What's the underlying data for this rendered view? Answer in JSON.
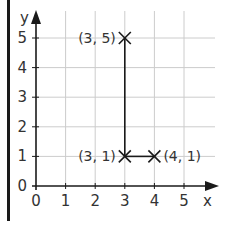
{
  "chart_data": {
    "type": "scatter",
    "title": "",
    "xlabel": "x",
    "ylabel": "y",
    "xlim": [
      0,
      5
    ],
    "ylim": [
      0,
      5
    ],
    "grid": true,
    "x_ticks": [
      "0",
      "1",
      "2",
      "3",
      "4",
      "5"
    ],
    "y_ticks": [
      "0",
      "1",
      "2",
      "3",
      "4",
      "5"
    ],
    "points": [
      {
        "x": 3,
        "y": 5,
        "label": "(3, 5)",
        "label_side": "left"
      },
      {
        "x": 3,
        "y": 1,
        "label": "(3, 1)",
        "label_side": "left"
      },
      {
        "x": 4,
        "y": 1,
        "label": "(4, 1)",
        "label_side": "right"
      }
    ],
    "segments": [
      {
        "from": [
          3,
          5
        ],
        "to": [
          3,
          1
        ]
      },
      {
        "from": [
          3,
          1
        ],
        "to": [
          4,
          1
        ]
      }
    ],
    "marker": "x",
    "colors": {
      "axis": "#1a1a1a",
      "grid": "#cccccc",
      "text": "#333333",
      "border": "#1a1a1a"
    }
  }
}
